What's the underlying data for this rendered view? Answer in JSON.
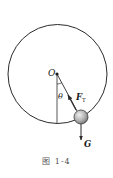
{
  "figure": {
    "caption": "图 1-4",
    "labels": {
      "pivot": "O",
      "angle": "θ",
      "tension": "F",
      "tension_sub": "T",
      "gravity": "G"
    },
    "geometry": {
      "circle": {
        "cx": 57.5,
        "cy": 74,
        "r": 49.5
      },
      "pivot": {
        "x": 57,
        "y": 74
      },
      "ball": {
        "cx": 81,
        "cy": 117,
        "r": 7
      },
      "vertical_line_end_y": 124,
      "gravity_arrow_end_y": 140
    },
    "colors": {
      "stroke": "#2b2b2b",
      "ball_light": "#e6e6e6",
      "ball_dark": "#7a7a7a",
      "caption": "#555555"
    }
  }
}
